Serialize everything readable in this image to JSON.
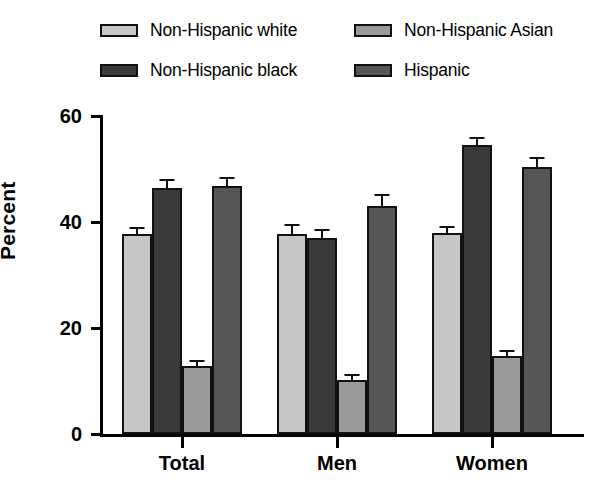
{
  "chart_data": {
    "type": "bar",
    "title": "",
    "xlabel": "",
    "ylabel": "Percent",
    "categories": [
      "Total",
      "Men",
      "Women"
    ],
    "ylim": [
      0,
      60
    ],
    "yticks": [
      0,
      20,
      40,
      60
    ],
    "ytick_labels": [
      "0",
      "20",
      "40",
      "60"
    ],
    "grid": false,
    "legend_position": "top",
    "error_bars": "standard error",
    "series": [
      {
        "name": "Non-Hispanic white",
        "color": "#c6c6c6",
        "values": [
          37.8,
          37.7,
          38.0
        ],
        "errors": [
          1.3,
          1.9,
          1.3
        ]
      },
      {
        "name": "Non-Hispanic black",
        "color": "#3a3a3a",
        "values": [
          46.5,
          36.9,
          54.6
        ],
        "errors": [
          1.6,
          1.7,
          1.5
        ]
      },
      {
        "name": "Non-Hispanic Asian",
        "color": "#9a9a9a",
        "values": [
          12.8,
          10.2,
          14.8
        ],
        "errors": [
          1.2,
          1.2,
          1.1
        ]
      },
      {
        "name": "Hispanic",
        "color": "#565656",
        "values": [
          46.8,
          43.0,
          50.4
        ],
        "errors": [
          1.7,
          2.2,
          1.8
        ]
      }
    ]
  }
}
